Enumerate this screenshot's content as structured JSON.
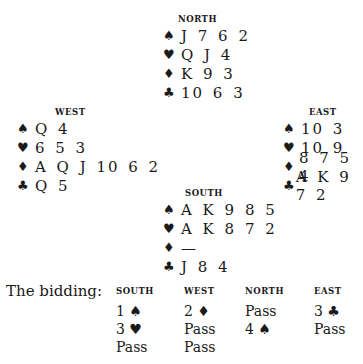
{
  "hands": {
    "north": {
      "label": "NORTH",
      "spades": "J 7 6 2",
      "hearts": "Q J 4",
      "diamonds": "K 9 3",
      "clubs": "10 6 3"
    },
    "west": {
      "label": "WEST",
      "spades": "Q 4",
      "hearts": "6 5 3",
      "diamonds": "A Q J 10 6 2",
      "clubs": "Q 5"
    },
    "east": {
      "label": "EAST",
      "spades": "10 3",
      "hearts": "10 9",
      "diamonds": "8 7 5 4",
      "clubs": "A K 9 7 2"
    },
    "south": {
      "label": "SOUTH",
      "spades": "A K 9 8 5",
      "hearts": "A K 8 7 2",
      "diamonds": "—",
      "clubs": "J 8 4"
    }
  },
  "suits": {
    "spade": "♠",
    "heart": "♥",
    "diamond": "♦",
    "club": "♣"
  },
  "bidding": {
    "intro": "The bidding:",
    "columns": [
      {
        "label": "SOUTH",
        "bids": [
          "1 ♠",
          "3 ♥",
          "Pass"
        ]
      },
      {
        "label": "WEST",
        "bids": [
          "2 ♦",
          "Pass",
          "Pass"
        ]
      },
      {
        "label": "NORTH",
        "bids": [
          "Pass",
          "4 ♠"
        ]
      },
      {
        "label": "EAST",
        "bids": [
          "3 ♣",
          "Pass"
        ]
      }
    ]
  }
}
